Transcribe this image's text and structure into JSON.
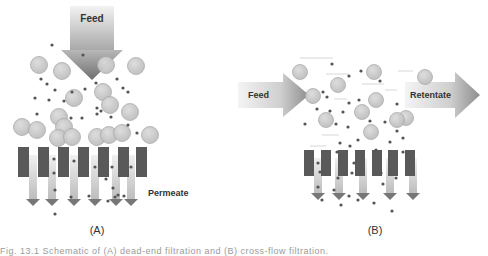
{
  "colors": {
    "particle_fill": "#c4c4c4",
    "particle_stroke": "#a8a8a8",
    "solute": "#555555",
    "membrane": "#595959",
    "arrow_light": "#eeeeee",
    "arrow_dark": "#8a8a8a",
    "permeate_arrow_dark": "#777777",
    "text": "#333333"
  },
  "panelA": {
    "label": "(A)",
    "feed_label": "Feed",
    "permeate_label": "Permeate",
    "feed_arrow": {
      "x": 70,
      "y": 6,
      "w": 44,
      "shaft_h": 44,
      "head_w": 62,
      "head_h": 30
    },
    "large_particles": [
      [
        39,
        65
      ],
      [
        62,
        71
      ],
      [
        106,
        65
      ],
      [
        136,
        66
      ],
      [
        103,
        92
      ],
      [
        74,
        98
      ],
      [
        110,
        105
      ],
      [
        130,
        112
      ],
      [
        59,
        117
      ],
      [
        64,
        127
      ],
      [
        22,
        127
      ],
      [
        37,
        130
      ],
      [
        58,
        138
      ],
      [
        72,
        137
      ],
      [
        97,
        137
      ],
      [
        109,
        135
      ],
      [
        122,
        133
      ],
      [
        150,
        135
      ]
    ],
    "solutes": [
      [
        52,
        45
      ],
      [
        83,
        55
      ],
      [
        41,
        79
      ],
      [
        47,
        84
      ],
      [
        55,
        90
      ],
      [
        72,
        92
      ],
      [
        85,
        89
      ],
      [
        96,
        83
      ],
      [
        117,
        79
      ],
      [
        123,
        88
      ],
      [
        128,
        92
      ],
      [
        35,
        98
      ],
      [
        49,
        100
      ],
      [
        64,
        101
      ],
      [
        97,
        108
      ],
      [
        101,
        111
      ],
      [
        37,
        114
      ],
      [
        71,
        118
      ],
      [
        82,
        118
      ],
      [
        97,
        114
      ],
      [
        111,
        117
      ],
      [
        128,
        125
      ],
      [
        137,
        133
      ],
      [
        54,
        159
      ],
      [
        74,
        161
      ],
      [
        54,
        173
      ],
      [
        95,
        167
      ],
      [
        112,
        167
      ],
      [
        131,
        167
      ],
      [
        106,
        179
      ],
      [
        113,
        188
      ],
      [
        118,
        195
      ],
      [
        55,
        190
      ],
      [
        71,
        197
      ],
      [
        89,
        196
      ],
      [
        108,
        201
      ],
      [
        115,
        197
      ],
      [
        124,
        196
      ],
      [
        55,
        214
      ]
    ],
    "membrane_bars": [
      18,
      38,
      58,
      78,
      98,
      118,
      136
    ],
    "membrane_y": 147,
    "membrane_h": 30,
    "bar_w": 11,
    "permeate_arrows": [
      33,
      52,
      74,
      95,
      116,
      131
    ],
    "permeate_arrow_top": 155,
    "permeate_arrow_bottom": 206,
    "permeate_label_pos": [
      148,
      196
    ],
    "label_pos": [
      97,
      234
    ]
  },
  "panelB": {
    "label": "(B)",
    "feed_label": "Feed",
    "retentate_label": "Retentate",
    "feed_arrow": {
      "x": 238,
      "y": 75,
      "shaft_w": 45,
      "shaft_h": 26,
      "head_w": 26,
      "head_h": 44
    },
    "retentate_arrow": {
      "x": 405,
      "y": 75,
      "shaft_w": 50,
      "shaft_h": 26,
      "head_w": 25,
      "head_h": 46
    },
    "large_particles": [
      [
        300,
        72
      ],
      [
        338,
        85
      ],
      [
        374,
        72
      ],
      [
        425,
        77
      ],
      [
        313,
        96
      ],
      [
        376,
        100
      ],
      [
        362,
        112
      ],
      [
        326,
        120
      ],
      [
        406,
        118
      ],
      [
        371,
        132
      ],
      [
        397,
        120
      ]
    ],
    "solutes": [
      [
        332,
        64
      ],
      [
        349,
        76
      ],
      [
        361,
        71
      ],
      [
        380,
        81
      ],
      [
        323,
        92
      ],
      [
        327,
        97
      ],
      [
        349,
        103
      ],
      [
        359,
        100
      ],
      [
        397,
        104
      ],
      [
        317,
        109
      ],
      [
        330,
        111
      ],
      [
        343,
        112
      ],
      [
        305,
        124
      ],
      [
        336,
        124
      ],
      [
        348,
        127
      ],
      [
        370,
        121
      ],
      [
        385,
        122
      ],
      [
        397,
        131
      ],
      [
        340,
        143
      ],
      [
        358,
        140
      ],
      [
        390,
        142
      ],
      [
        403,
        138
      ],
      [
        337,
        152
      ],
      [
        350,
        146
      ],
      [
        376,
        150
      ],
      [
        403,
        152
      ],
      [
        318,
        163
      ],
      [
        354,
        163
      ],
      [
        320,
        172
      ],
      [
        338,
        178
      ],
      [
        352,
        173
      ],
      [
        381,
        173
      ],
      [
        396,
        178
      ],
      [
        383,
        184
      ],
      [
        318,
        187
      ],
      [
        334,
        190
      ],
      [
        349,
        196
      ],
      [
        322,
        200
      ],
      [
        341,
        205
      ],
      [
        358,
        200
      ],
      [
        374,
        203
      ],
      [
        392,
        211
      ]
    ],
    "membrane_bars": [
      304,
      321,
      338,
      355,
      372,
      388,
      405
    ],
    "membrane_y": 150,
    "membrane_h": 26,
    "bar_w": 10,
    "permeate_arrows": [
      318,
      339,
      363,
      390,
      413
    ],
    "permeate_arrow_top": 158,
    "permeate_arrow_bottom": 200,
    "permeate_label_pos": [
      429,
      188
    ],
    "label_pos": [
      375,
      234
    ],
    "streamlines": [
      [
        300,
        58,
        333,
        58
      ],
      [
        326,
        74,
        349,
        74
      ],
      [
        362,
        84,
        384,
        84
      ],
      [
        385,
        90,
        397,
        90
      ],
      [
        398,
        71,
        413,
        71
      ],
      [
        334,
        99,
        347,
        99
      ],
      [
        322,
        135,
        339,
        135
      ],
      [
        310,
        146,
        326,
        146
      ]
    ]
  },
  "caption": "Fig. 13.1 Schematic of (A) dead-end filtration and (B) cross-flow filtration."
}
